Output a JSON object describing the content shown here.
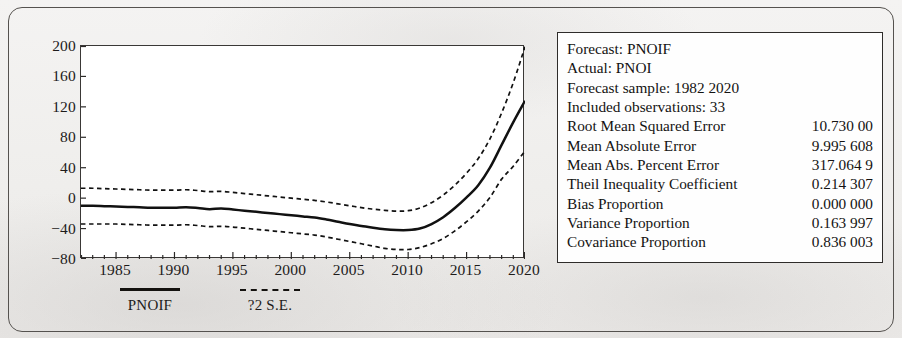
{
  "chart_data": {
    "type": "line",
    "title": "",
    "xlabel": "",
    "ylabel": "",
    "xlim": [
      1982,
      2020
    ],
    "ylim": [
      -80,
      200
    ],
    "grid": false,
    "legend_position": "below-axis",
    "y_ticks": [
      "200",
      "160",
      "120",
      "80",
      "40",
      "0",
      "−40",
      "−80"
    ],
    "y_tick_values": [
      200,
      160,
      120,
      80,
      40,
      0,
      -40,
      -80
    ],
    "x_ticks": [
      "1985",
      "1990",
      "1995",
      "2000",
      "2005",
      "2010",
      "2015",
      "2020"
    ],
    "x_tick_values": [
      1985,
      1990,
      1995,
      2000,
      2005,
      2010,
      2015,
      2020
    ],
    "x": [
      1982,
      1983,
      1984,
      1985,
      1986,
      1987,
      1988,
      1989,
      1990,
      1991,
      1992,
      1993,
      1994,
      1995,
      1996,
      1997,
      1998,
      1999,
      2000,
      2001,
      2002,
      2003,
      2004,
      2005,
      2006,
      2007,
      2008,
      2009,
      2010,
      2011,
      2012,
      2013,
      2014,
      2015,
      2016,
      2017,
      2018,
      2019,
      2020
    ],
    "series": [
      {
        "name": "PNOIF",
        "style": "solid",
        "color": "#111111",
        "values": [
          -10,
          -10,
          -10.5,
          -11,
          -11.5,
          -12,
          -12.5,
          -12.5,
          -12.5,
          -12,
          -13,
          -14.5,
          -13.5,
          -15,
          -16.5,
          -18,
          -19.5,
          -21,
          -22.5,
          -24,
          -25.5,
          -28,
          -31,
          -34,
          -36.5,
          -39,
          -41,
          -42,
          -42,
          -40,
          -34,
          -25,
          -13,
          1,
          17,
          40,
          70,
          100,
          128
        ]
      },
      {
        "name": "+2 S.E.",
        "style": "dashed",
        "color": "#111111",
        "values": [
          13,
          13,
          12.5,
          12,
          11.5,
          11,
          10.5,
          10.5,
          10.5,
          11,
          10,
          8.5,
          9,
          7.5,
          6,
          4.5,
          3,
          1.5,
          0,
          -1.5,
          -3,
          -5,
          -7.5,
          -10,
          -12.5,
          -14.5,
          -16,
          -17,
          -16.5,
          -13,
          -6,
          4,
          17,
          33,
          52,
          78,
          112,
          152,
          199
        ]
      },
      {
        "name": "-2 S.E.",
        "style": "dashed",
        "color": "#111111",
        "values": [
          -34,
          -34,
          -34,
          -34,
          -34.5,
          -35,
          -35.5,
          -35.5,
          -35.5,
          -35,
          -36,
          -37.5,
          -37,
          -38,
          -39.5,
          -41,
          -42.5,
          -44,
          -45.5,
          -47,
          -48.5,
          -51,
          -54,
          -57,
          -60,
          -63,
          -66,
          -67.5,
          -67.5,
          -65,
          -60,
          -53,
          -43,
          -31,
          -17,
          1,
          25,
          42,
          62
        ]
      }
    ],
    "legend": [
      {
        "label": "PNOIF",
        "style": "solid"
      },
      {
        "label": "?2 S.E.",
        "style": "dashed"
      }
    ]
  },
  "stats": {
    "rows": [
      {
        "label": "Forecast: PNOIF",
        "value": "",
        "indented": false
      },
      {
        "label": "Actual: PNOI",
        "value": "",
        "indented": false
      },
      {
        "label": "Forecast sample: 1982 2020",
        "value": "",
        "indented": false
      },
      {
        "label": "Included observations: 33",
        "value": "",
        "indented": false
      },
      {
        "label": "Root Mean Squared Error",
        "value": "10.730 00",
        "indented": false
      },
      {
        "label": "Mean Absolute Error",
        "value": "9.995 608",
        "indented": false
      },
      {
        "label": "Mean Abs. Percent Error",
        "value": "317.064 9",
        "indented": false
      },
      {
        "label": "Theil Inequality Coefficient",
        "value": "0.214 307",
        "indented": false
      },
      {
        "label": "Bias Proportion",
        "value": "0.000 000",
        "indented": true
      },
      {
        "label": "Variance Proportion",
        "value": "0.163 997",
        "indented": true
      },
      {
        "label": "Covariance Proportion",
        "value": "0.836 003",
        "indented": true
      }
    ]
  }
}
